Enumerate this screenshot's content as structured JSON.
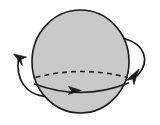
{
  "figure": {
    "title": "Rotating sphere with equatorial direction arrows",
    "type": "geometric-diagram",
    "canvas": {
      "width": 160,
      "height": 125,
      "background": "#ffffff"
    },
    "colors": {
      "sphere_fill": "#c9c9c9",
      "outline": "#1a1a1a",
      "arrow": "#1a1a1a",
      "background": "#ffffff"
    },
    "sphere": {
      "label": "sphere-body",
      "center_x": 80.5,
      "center_y": 61.5,
      "radius_x": 48.5,
      "radius_y": 51.5,
      "stroke_width": 1.6,
      "fill": "#c9c9c9"
    },
    "equator": {
      "label": "equator-ellipse",
      "center_x": 81.5,
      "center_y": 83.5,
      "radius_x": 46.5,
      "radius_y": 11.5,
      "back_half_style": "dashed",
      "front_half_style": "solid",
      "dash_pattern": "5,4",
      "stroke_width": 1.6
    },
    "arrows": [
      {
        "name": "equator-direction-arrow",
        "position": "front-equator-center",
        "direction": "right",
        "tip_x": 80,
        "tip_y": 90,
        "style": "solid-triangle-head"
      },
      {
        "name": "left-rotation-arrow",
        "position": "left-of-sphere",
        "direction": "down-left",
        "tip_x": 14,
        "tip_y": 54,
        "style": "curved-arc-with-head"
      },
      {
        "name": "right-rotation-arrow",
        "position": "right-of-sphere",
        "direction": "up-right",
        "tip_x": 138,
        "tip_y": 70,
        "style": "curved-arc-with-head"
      }
    ]
  }
}
